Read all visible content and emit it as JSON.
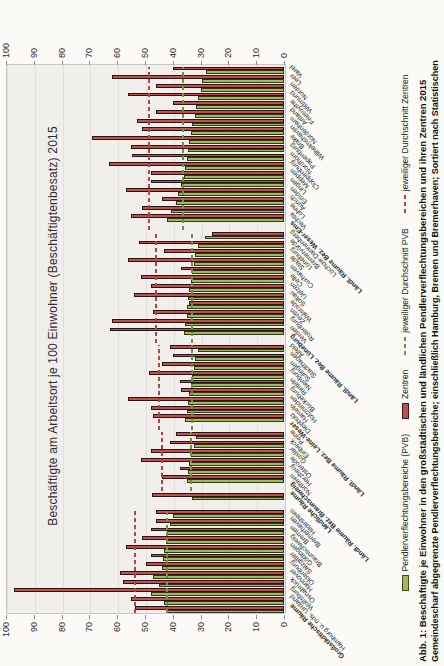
{
  "figure": {
    "title": "Beschäftigte am Arbeitsort je 100 Einwohner (Beschäftigtenbesatz) 2015",
    "caption_line1": "Abb. 1: Beschäftigte je Einwohner in den großstädtischen und ländlichen Pendlerverflechtungsbereichen und ihren Zentren 2015",
    "caption_line2": "Gemeindescharf abgegrenzte Pendlerverflechtungsbereiche; einschließlich Hamburg, Bremen und Bremerhaven; Sortiert nach Statistischen"
  },
  "legend": {
    "pvb": "Pendlerverflechtungsbereiche (PVB)",
    "zentren": "Zentren",
    "avg_pvb": "jeweiliger Durchschnitt PVB",
    "avg_zentren": "jeweiliger Durchschnitt Zentren"
  },
  "colors": {
    "pvb_fill": "#9bbb59",
    "zentren_fill": "#c0504d",
    "avg_pvb_line": "#6f9440",
    "avg_zentren_line": "#b8423e",
    "plot_bg": "#f0efeb",
    "page_bg": "#fbfaf6"
  },
  "chart_data": {
    "type": "bar",
    "note": "vertical clustered bars; whole figure printed rotated 90° counterclockwise on the page",
    "title": "Beschäftigte am Arbeitsort je 100 Einwohner (Beschäftigtenbesatz) 2015",
    "ylim": [
      0,
      100
    ],
    "yticks": [
      0,
      10,
      20,
      30,
      40,
      50,
      60,
      70,
      80,
      90,
      100
    ],
    "series_names": [
      "Pendlerverflechtungsbereiche (PVB)",
      "Zentren"
    ],
    "groups": [
      {
        "id": "gross",
        "avg_pvb": 42,
        "avg_zentren": 53.5
      },
      {
        "id": "laendlich",
        "avg_pvb": null,
        "avg_zentren": null
      },
      {
        "id": "braunschweig",
        "avg_pvb": 33.5,
        "avg_zentren": 44
      },
      {
        "id": "leine",
        "avg_pvb": 33,
        "avg_zentren": 45
      },
      {
        "id": "lueneburg",
        "avg_pvb": 33,
        "avg_zentren": 46
      },
      {
        "id": "weser",
        "avg_pvb": 36.5,
        "avg_zentren": 48.5
      }
    ],
    "categories": [
      {
        "label": "Großstädtische Räume",
        "group": "gross",
        "bold": true,
        "pvb": 42,
        "zentren": 53.5
      },
      {
        "label": "Hamburg u. nds. Umland",
        "group": "gross",
        "bold": false,
        "pvb": 43,
        "zentren": 55
      },
      {
        "label": "Wolfsburg",
        "group": "gross",
        "bold": false,
        "pvb": 48,
        "zentren": 97
      },
      {
        "label": "Osnabrück",
        "group": "gross",
        "bold": false,
        "pvb": 45,
        "zentren": 58
      },
      {
        "label": "Hannover",
        "group": "gross",
        "bold": false,
        "pvb": 47,
        "zentren": 59
      },
      {
        "label": "Oldenburg",
        "group": "gross",
        "bold": false,
        "pvb": 44,
        "zentren": 49.5
      },
      {
        "label": "Salzgitter",
        "group": "gross",
        "bold": false,
        "pvb": 43.5,
        "zentren": 48
      },
      {
        "label": "Göttingen",
        "group": "gross",
        "bold": false,
        "pvb": 43,
        "zentren": 57
      },
      {
        "label": "Braunschweig",
        "group": "gross",
        "bold": false,
        "pvb": 42.5,
        "zentren": 51
      },
      {
        "label": "Bremen",
        "group": "gross",
        "bold": false,
        "pvb": 42,
        "zentren": 48
      },
      {
        "label": "Bremerhaven",
        "group": "gross",
        "bold": false,
        "pvb": 41,
        "zentren": 46
      },
      {
        "label": "Hildesheim",
        "group": "gross",
        "bold": false,
        "pvb": 40,
        "zentren": 46
      },
      {
        "label": "",
        "group": null,
        "bold": false,
        "pvb": null,
        "zentren": null
      },
      {
        "label": "Ländliche Räume",
        "group": "laendlich",
        "bold": true,
        "pvb": 33,
        "zentren": 47.5
      },
      {
        "label": "Ländl. Räume Bez. Braunschweig",
        "group": "braunschweig",
        "bold": true,
        "pvb": null,
        "zentren": null
      },
      {
        "label": "Northeim",
        "group": "braunschweig",
        "bold": false,
        "pvb": 35,
        "zentren": 44
      },
      {
        "label": "Herzberg",
        "group": "braunschweig",
        "bold": false,
        "pvb": 34.5,
        "zentren": 37.5
      },
      {
        "label": "Osterode",
        "group": "braunschweig",
        "bold": false,
        "pvb": 34,
        "zentren": 51.5
      },
      {
        "label": "Goslar",
        "group": "braunschweig",
        "bold": false,
        "pvb": 33.5,
        "zentren": 48
      },
      {
        "label": "Einbeck",
        "group": "braunschweig",
        "bold": false,
        "pvb": 32.5,
        "zentren": 41
      },
      {
        "label": "Peine",
        "group": "braunschweig",
        "bold": false,
        "pvb": 31.5,
        "zentren": 39
      },
      {
        "label": "Ländl. Räume Bez. Leine-Weser",
        "group": "leine",
        "bold": true,
        "pvb": null,
        "zentren": null
      },
      {
        "label": "Diepholz",
        "group": "leine",
        "bold": false,
        "pvb": 35.5,
        "zentren": 47
      },
      {
        "label": "Hameln",
        "group": "leine",
        "bold": false,
        "pvb": 35,
        "zentren": 48
      },
      {
        "label": "Holzminden",
        "group": "leine",
        "bold": false,
        "pvb": 34.5,
        "zentren": 56
      },
      {
        "label": "Bückeburg",
        "group": "leine",
        "bold": false,
        "pvb": 34,
        "zentren": 37
      },
      {
        "label": "Rinteln",
        "group": "leine",
        "bold": false,
        "pvb": 33.5,
        "zentren": 37.5
      },
      {
        "label": "Nienburg",
        "group": "leine",
        "bold": false,
        "pvb": 33,
        "zentren": 48.5
      },
      {
        "label": "Sulingen",
        "group": "leine",
        "bold": false,
        "pvb": 32.5,
        "zentren": 44
      },
      {
        "label": "Stadthagen",
        "group": "leine",
        "bold": false,
        "pvb": 32,
        "zentren": 40
      },
      {
        "label": "Alfeld",
        "group": "leine",
        "bold": false,
        "pvb": 31,
        "zentren": 41
      },
      {
        "label": "Ländl. Räume Bez. Lüneburg",
        "group": "lueneburg",
        "bold": true,
        "pvb": null,
        "zentren": null
      },
      {
        "label": "Verden",
        "group": "lueneburg",
        "bold": false,
        "pvb": 36,
        "zentren": 62.5
      },
      {
        "label": "Rotenburg",
        "group": "lueneburg",
        "bold": false,
        "pvb": 35.5,
        "zentren": 62
      },
      {
        "label": "Zeven",
        "group": "lueneburg",
        "bold": false,
        "pvb": 35,
        "zentren": 47
      },
      {
        "label": "Walsrode",
        "group": "lueneburg",
        "bold": false,
        "pvb": 35,
        "zentren": 34
      },
      {
        "label": "Soltau",
        "group": "lueneburg",
        "bold": false,
        "pvb": 34.5,
        "zentren": 54
      },
      {
        "label": "Uelzen",
        "group": "lueneburg",
        "bold": false,
        "pvb": 34,
        "zentren": 48
      },
      {
        "label": "Celle",
        "group": "lueneburg",
        "bold": false,
        "pvb": 33.5,
        "zentren": 51.5
      },
      {
        "label": "Cuxhaven",
        "group": "lueneburg",
        "bold": false,
        "pvb": 33,
        "zentren": 37
      },
      {
        "label": "Stade",
        "group": "lueneburg",
        "bold": false,
        "pvb": 32.5,
        "zentren": 56
      },
      {
        "label": "Lüneburg",
        "group": "lueneburg",
        "bold": false,
        "pvb": 32,
        "zentren": 43
      },
      {
        "label": "Bremervörde",
        "group": "lueneburg",
        "bold": false,
        "pvb": 31,
        "zentren": 52
      },
      {
        "label": "Lüchow-Dannenberg",
        "group": "lueneburg",
        "bold": false,
        "pvb": 28.5,
        "zentren": 26
      },
      {
        "label": "Ländl. Räume Bez. Weser-Ems",
        "group": "weser",
        "bold": true,
        "pvb": null,
        "zentren": null
      },
      {
        "label": "Vechta",
        "group": "weser",
        "bold": false,
        "pvb": 42,
        "zentren": 55
      },
      {
        "label": "Lohne",
        "group": "weser",
        "bold": false,
        "pvb": 40.5,
        "zentren": 51
      },
      {
        "label": "Aurich",
        "group": "weser",
        "bold": false,
        "pvb": 39,
        "zentren": 44
      },
      {
        "label": "Emden",
        "group": "weser",
        "bold": false,
        "pvb": 38,
        "zentren": 57
      },
      {
        "label": "Lingen",
        "group": "weser",
        "bold": false,
        "pvb": 37,
        "zentren": 48
      },
      {
        "label": "Meppen",
        "group": "weser",
        "bold": false,
        "pvb": 36,
        "zentren": 48
      },
      {
        "label": "Cloppenburg",
        "group": "weser",
        "bold": false,
        "pvb": 35.5,
        "zentren": 63
      },
      {
        "label": "Nordhorn",
        "group": "weser",
        "bold": false,
        "pvb": 35,
        "zentren": 54.5
      },
      {
        "label": "Papenburg",
        "group": "weser",
        "bold": false,
        "pvb": 34.5,
        "zentren": 55
      },
      {
        "label": "Brake",
        "group": "weser",
        "bold": false,
        "pvb": 34,
        "zentren": 69
      },
      {
        "label": "Wilhelmshaven",
        "group": "weser",
        "bold": false,
        "pvb": 33.5,
        "zentren": 51
      },
      {
        "label": "Nordenham",
        "group": "weser",
        "bold": false,
        "pvb": 33,
        "zentren": 53
      },
      {
        "label": "Artland",
        "group": "weser",
        "bold": false,
        "pvb": 32,
        "zentren": 46
      },
      {
        "label": "Friesoythe",
        "group": "weser",
        "bold": false,
        "pvb": 31.5,
        "zentren": 40
      },
      {
        "label": "Wittmund",
        "group": "weser",
        "bold": false,
        "pvb": 31,
        "zentren": 56
      },
      {
        "label": "Norden",
        "group": "weser",
        "bold": false,
        "pvb": 30,
        "zentren": 46
      },
      {
        "label": "Leer",
        "group": "weser",
        "bold": false,
        "pvb": 29.5,
        "zentren": 62
      },
      {
        "label": "Varel",
        "group": "weser",
        "bold": false,
        "pvb": 28,
        "zentren": 40
      }
    ]
  }
}
